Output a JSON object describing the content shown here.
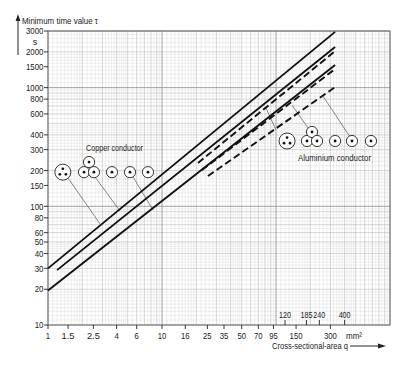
{
  "chart_data": {
    "type": "line",
    "title": "",
    "ylabel": "Minimum time value τ",
    "yunit": "s",
    "xlabel": "Cross-sectional-area q",
    "xunit": "mm²",
    "xscale": "log",
    "yscale": "log",
    "xlim": [
      1,
      1000
    ],
    "ylim": [
      10,
      3000
    ],
    "grid": true,
    "legend": null,
    "x_ticks": [
      1,
      1.5,
      2.5,
      4,
      6,
      10,
      16,
      25,
      35,
      50,
      70,
      95,
      150,
      300
    ],
    "x_tick_labels": [
      "1",
      "1.5",
      "2.5",
      "4",
      "6",
      "10",
      "16",
      "25",
      "35",
      "50",
      "70",
      "95",
      "150",
      "300"
    ],
    "x_ticks_upper": [
      120,
      185,
      240,
      400
    ],
    "x_tick_labels_upper": [
      "120",
      "185",
      "240",
      "400"
    ],
    "y_ticks": [
      3000,
      2000,
      1500,
      1000,
      800,
      600,
      400,
      300,
      200,
      150,
      100,
      80,
      60,
      50,
      40,
      30,
      20,
      10
    ],
    "y_tick_labels": [
      "3000",
      "2000",
      "1500",
      "1000",
      "800",
      "600",
      "400",
      "300",
      "200",
      "150",
      "100",
      "80",
      "60",
      "50",
      "40",
      "30",
      "20",
      "10"
    ],
    "series": [
      {
        "name": "Copper conductor – curve 1",
        "material": "copper",
        "style": "solid",
        "x": [
          1,
          330
        ],
        "y": [
          30,
          2950
        ]
      },
      {
        "name": "Copper conductor – curve 2",
        "material": "copper",
        "style": "solid",
        "x": [
          1.2,
          330
        ],
        "y": [
          29,
          2200
        ]
      },
      {
        "name": "Copper conductor – curve 3",
        "material": "copper",
        "style": "solid",
        "x": [
          1,
          330
        ],
        "y": [
          19.5,
          1550
        ]
      },
      {
        "name": "Aluminium conductor – curve 1",
        "material": "aluminium",
        "style": "dashed",
        "x": [
          20.7,
          330
        ],
        "y": [
          232,
          2030
        ]
      },
      {
        "name": "Aluminium conductor – curve 2",
        "material": "aluminium",
        "style": "dashed",
        "x": [
          22.4,
          330
        ],
        "y": [
          202,
          1435
        ]
      },
      {
        "name": "Aluminium conductor – curve 3",
        "material": "aluminium",
        "style": "dashed",
        "x": [
          25.3,
          330
        ],
        "y": [
          180,
          1010
        ]
      }
    ],
    "annotations": [
      {
        "text": "Copper conductor",
        "material": "copper"
      },
      {
        "text": "Aluminium conductor",
        "material": "aluminium"
      }
    ],
    "conductor_symbols": [
      {
        "material": "copper",
        "type": "three-core",
        "q": 1.35,
        "tau": 194
      },
      {
        "material": "copper",
        "type": "single-core",
        "q": 2.07,
        "tau": 194
      },
      {
        "material": "copper",
        "type": "single-core",
        "q": 2.29,
        "tau": 236
      },
      {
        "material": "copper",
        "type": "single-core",
        "q": 2.53,
        "tau": 194
      },
      {
        "material": "copper",
        "type": "single-core",
        "q": 3.64,
        "tau": 194
      },
      {
        "material": "copper",
        "type": "single-core",
        "q": 5.24,
        "tau": 194
      },
      {
        "material": "copper",
        "type": "single-core",
        "q": 7.53,
        "tau": 194
      },
      {
        "material": "aluminium",
        "type": "three-core",
        "q": 125,
        "tau": 355
      },
      {
        "material": "aluminium",
        "type": "single-core",
        "q": 187,
        "tau": 355
      },
      {
        "material": "aluminium",
        "type": "single-core",
        "q": 207,
        "tau": 423
      },
      {
        "material": "aluminium",
        "type": "single-core",
        "q": 229,
        "tau": 355
      },
      {
        "material": "aluminium",
        "type": "single-core",
        "q": 330,
        "tau": 355
      },
      {
        "material": "aluminium",
        "type": "single-core",
        "q": 464,
        "tau": 355
      },
      {
        "material": "aluminium",
        "type": "single-core",
        "q": 681,
        "tau": 355
      }
    ],
    "leader_lines": [
      {
        "material": "copper",
        "from": [
          1.5,
          173
        ],
        "to": [
          2.86,
          71
        ]
      },
      {
        "material": "copper",
        "from": [
          2.58,
          177
        ],
        "to": [
          4.28,
          91.3
        ]
      },
      {
        "material": "copper",
        "from": [
          5.57,
          177
        ],
        "to": [
          8.34,
          93
        ]
      },
      {
        "material": "aluminium",
        "from": [
          100,
          440
        ],
        "to": [
          81.7,
          673
        ]
      },
      {
        "material": "aluminium",
        "from": [
          191,
          457
        ],
        "to": [
          138,
          713
        ]
      },
      {
        "material": "aluminium",
        "from": [
          446,
          384
        ],
        "to": [
          258,
          850
        ]
      }
    ]
  }
}
